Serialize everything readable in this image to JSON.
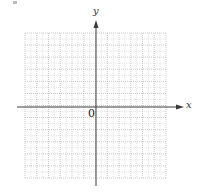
{
  "diagram": {
    "type": "cartesian-coordinate-grid",
    "x_axis_label": "x",
    "y_axis_label": "y",
    "origin_label": "0",
    "grid": {
      "columns": 12,
      "rows": 12,
      "minor_subdivisions": 2,
      "left": 25,
      "top": 33,
      "right": 166,
      "bottom": 178
    },
    "origin_px": {
      "x": 96,
      "y": 107
    },
    "x_axis_extent": {
      "from": 17,
      "to": 184
    },
    "y_axis_extent": {
      "from": 20,
      "to": 186
    },
    "colors": {
      "axis": "#3a3a3a",
      "grid": "#b4b4b4",
      "background": "#ffffff"
    }
  }
}
